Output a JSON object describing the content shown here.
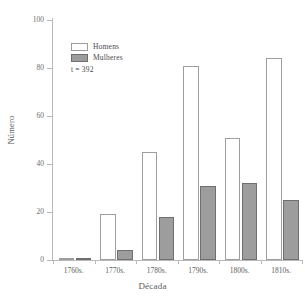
{
  "chart_data": {
    "type": "bar",
    "title": "",
    "xlabel": "Década",
    "ylabel": "Número",
    "categories": [
      "1760s.",
      "1770s.",
      "1780s.",
      "1790s.",
      "1800s.",
      "1810s."
    ],
    "series": [
      {
        "name": "Homens",
        "values": [
          1,
          19,
          45,
          81,
          51,
          84
        ]
      },
      {
        "name": "Mulheres",
        "values": [
          1,
          4,
          18,
          31,
          32,
          25
        ]
      }
    ],
    "ylim": [
      0,
      100
    ],
    "yticks": [
      0,
      20,
      40,
      60,
      80,
      100
    ],
    "ytick_labels": [
      "0",
      "20",
      "40",
      "60",
      "80",
      "100"
    ],
    "grid": false,
    "legend_position": "upper-left-inside",
    "annotation": "t = 392",
    "colors": {
      "homens_fill": "#ffffff",
      "homens_border": "#9e9e9e",
      "mulheres_fill": "#9d9d9d",
      "mulheres_border": "#6f6f6f",
      "axis": "#b9b9b9",
      "text": "#4a4a4a"
    }
  }
}
